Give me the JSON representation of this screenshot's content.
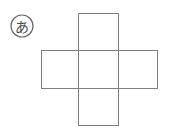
{
  "figure": {
    "label": {
      "text": "あ",
      "style": "circled",
      "center_x": 22,
      "center_y": 26,
      "radius": 11
    },
    "stroke_color": "#808080",
    "label_stroke_color": "#666666",
    "label_text_color": "#4a4a4a",
    "background_color": "#ffffff",
    "shape_name": "cross-net",
    "rectangles": [
      {
        "name": "vertical-bar",
        "x": 78,
        "y": 13,
        "width": 40,
        "height": 112
      },
      {
        "name": "horizontal-bar",
        "x": 41,
        "y": 50,
        "width": 116,
        "height": 38
      }
    ]
  }
}
